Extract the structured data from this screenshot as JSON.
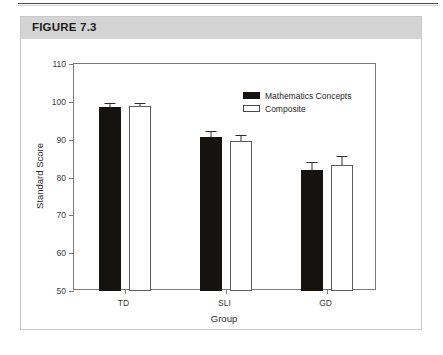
{
  "figure": {
    "label": "FIGURE 7.3"
  },
  "legend": {
    "position": "top-right",
    "items": [
      {
        "name": "Mathematics Concepts",
        "swatch": "dark"
      },
      {
        "name": "Composite",
        "swatch": "light"
      }
    ]
  },
  "chart_data": {
    "type": "bar",
    "title": "",
    "xlabel": "Group",
    "ylabel": "Standard Score",
    "categories": [
      "TD",
      "SLI",
      "GD"
    ],
    "ylim": [
      50,
      110
    ],
    "yticks": [
      50,
      60,
      70,
      80,
      90,
      100,
      110
    ],
    "grid": false,
    "legend_position": "top-right",
    "series": [
      {
        "name": "Mathematics Concepts",
        "color": "#151210",
        "values": [
          98.7,
          90.7,
          82.0
        ],
        "errors": [
          1.0,
          1.6,
          2.0
        ]
      },
      {
        "name": "Composite",
        "color": "#ffffff",
        "values": [
          98.8,
          89.7,
          83.3
        ],
        "errors": [
          1.0,
          1.6,
          2.5
        ]
      }
    ]
  }
}
